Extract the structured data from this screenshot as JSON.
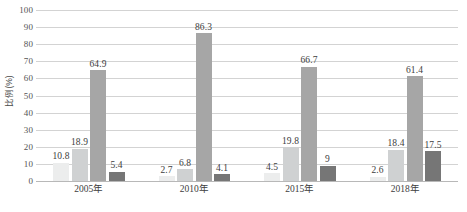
{
  "chart_data": {
    "type": "bar",
    "title": "",
    "subtitle": "",
    "xlabel": "",
    "ylabel": "比例(%)",
    "ylim": [
      0,
      100
    ],
    "ytick_labels": [
      "100",
      "90",
      "80",
      "70",
      "60",
      "50",
      "40",
      "30",
      "20",
      "10",
      "0"
    ],
    "ytick_values": [
      100,
      90,
      80,
      70,
      60,
      50,
      40,
      30,
      20,
      10,
      0
    ],
    "grid": true,
    "grid_orientation": "horizontal",
    "legend": false,
    "legend_position": "none",
    "categories": [
      "2005年",
      "2010年",
      "2015年",
      "2018年"
    ],
    "series": [
      {
        "name": "series-1",
        "color": "#eceded",
        "values": [
          10.8,
          2.7,
          4.5,
          2.6
        ],
        "labels": [
          "10.8",
          "2.7",
          "4.5",
          "2.6"
        ]
      },
      {
        "name": "series-2",
        "color": "#cfd1d2",
        "values": [
          18.9,
          6.8,
          19.8,
          18.4
        ],
        "labels": [
          "18.9",
          "6.8",
          "19.8",
          "18.4"
        ]
      },
      {
        "name": "series-3",
        "color": "#a6a6a6",
        "values": [
          64.9,
          86.3,
          66.7,
          61.4
        ],
        "labels": [
          "64.9",
          "86.3",
          "66.7",
          "61.4"
        ]
      },
      {
        "name": "series-4",
        "color": "#767676",
        "values": [
          5.4,
          4.1,
          9.0,
          17.5
        ],
        "labels": [
          "5.4",
          "4.1",
          "9",
          "17.5"
        ]
      }
    ]
  }
}
